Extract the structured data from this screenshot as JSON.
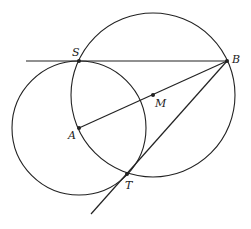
{
  "diagram": {
    "stroke_color": "#222222",
    "background": "#ffffff",
    "points": {
      "S": {
        "label": "S",
        "x": 79,
        "y": 61
      },
      "B": {
        "label": "B",
        "x": 227,
        "y": 61
      },
      "A": {
        "label": "A",
        "x": 79,
        "y": 128
      },
      "M": {
        "label": "M",
        "x": 153,
        "y": 95
      },
      "T": {
        "label": "T",
        "x": 127,
        "y": 174
      }
    },
    "circles": [
      {
        "name": "circle-A",
        "center": "A",
        "r": 67
      },
      {
        "name": "circle-M",
        "center": "M",
        "r": 82
      }
    ],
    "lines": [
      {
        "name": "tangent-SB",
        "from": [
          26,
          61
        ],
        "to": [
          227,
          61
        ]
      },
      {
        "name": "segment-AB",
        "from": [
          79,
          128
        ],
        "to": [
          227,
          61
        ]
      },
      {
        "name": "tangent-BT",
        "from": [
          227,
          61
        ],
        "to": [
          91,
          214
        ]
      }
    ]
  }
}
